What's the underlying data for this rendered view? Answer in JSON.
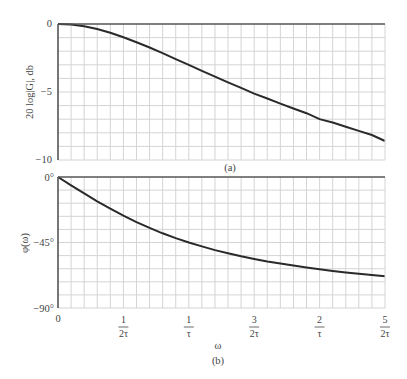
{
  "chart_data": [
    {
      "type": "line",
      "panel": "(a)",
      "title": "",
      "xlabel": "",
      "ylabel": "20 log|G|, db",
      "x_ticks": [
        "0",
        "1/2τ",
        "1/τ",
        "3/2τ",
        "2/τ",
        "5/2τ"
      ],
      "x_ticks_omega_tau": [
        0,
        0.5,
        1.0,
        1.5,
        2.0,
        2.5
      ],
      "y_ticks": [
        "0",
        "−5",
        "−10"
      ],
      "ylim": [
        -10,
        0
      ],
      "xlim_omega_tau": [
        0,
        2.5
      ],
      "grid": true,
      "grid_cols": 25,
      "grid_rows": 10,
      "series": [
        {
          "name": "magnitude",
          "x_omega_tau": [
            0,
            0.1,
            0.2,
            0.3,
            0.4,
            0.5,
            0.6,
            0.7,
            0.8,
            0.9,
            1.0,
            1.1,
            1.2,
            1.3,
            1.4,
            1.5,
            1.6,
            1.7,
            1.8,
            1.9,
            2.0,
            2.1,
            2.2,
            2.3,
            2.4,
            2.5
          ],
          "values": [
            0,
            -0.04,
            -0.17,
            -0.37,
            -0.64,
            -0.97,
            -1.34,
            -1.73,
            -2.15,
            -2.58,
            -3.01,
            -3.44,
            -3.87,
            -4.29,
            -4.7,
            -5.12,
            -5.48,
            -5.85,
            -6.21,
            -6.56,
            -6.99,
            -7.24,
            -7.55,
            -7.86,
            -8.16,
            -8.6
          ]
        }
      ]
    },
    {
      "type": "line",
      "panel": "(b)",
      "title": "",
      "xlabel": "ω",
      "ylabel": "φ(ω)",
      "x_ticks": [
        "0",
        "1/2τ",
        "1/τ",
        "3/2τ",
        "2/τ",
        "5/2τ"
      ],
      "x_ticks_omega_tau": [
        0,
        0.5,
        1.0,
        1.5,
        2.0,
        2.5
      ],
      "y_ticks": [
        "0°",
        "−45°",
        "−90°"
      ],
      "ylim": [
        -90,
        0
      ],
      "xlim_omega_tau": [
        0,
        2.5
      ],
      "grid": true,
      "grid_cols": 25,
      "grid_rows": 10,
      "series": [
        {
          "name": "phase",
          "x_omega_tau": [
            0,
            0.1,
            0.2,
            0.3,
            0.4,
            0.5,
            0.6,
            0.7,
            0.8,
            0.9,
            1.0,
            1.1,
            1.2,
            1.3,
            1.4,
            1.5,
            1.6,
            1.7,
            1.8,
            1.9,
            2.0,
            2.1,
            2.2,
            2.3,
            2.4,
            2.5
          ],
          "values": [
            0,
            -5.7,
            -11.3,
            -16.7,
            -21.8,
            -26.6,
            -31.0,
            -35.0,
            -38.7,
            -42.0,
            -45.0,
            -47.7,
            -50.2,
            -52.4,
            -54.5,
            -56.3,
            -58.0,
            -59.5,
            -60.9,
            -62.2,
            -63.4,
            -64.5,
            -65.6,
            -66.5,
            -67.4,
            -68.2
          ]
        }
      ]
    }
  ],
  "labels": {
    "top_ylabel": "20 log|G|, db",
    "top_y0": "0",
    "top_y5": "−5",
    "top_y10": "−10",
    "top_caption": "(a)",
    "bot_ylabel": "φ(ω)",
    "bot_y0": "0°",
    "bot_y45": "−45°",
    "bot_y90": "−90°",
    "bot_caption": "(b)",
    "xlabel": "ω",
    "x0": "0",
    "x_ticks": [
      {
        "num": "1",
        "den": "2τ"
      },
      {
        "num": "1",
        "den": "τ"
      },
      {
        "num": "3",
        "den": "2τ"
      },
      {
        "num": "2",
        "den": "τ"
      },
      {
        "num": "5",
        "den": "2τ"
      }
    ]
  },
  "colors": {
    "curve": "#2a2a2a",
    "axis": "#555555",
    "grid": "#d4d4d4",
    "text": "#444444"
  }
}
